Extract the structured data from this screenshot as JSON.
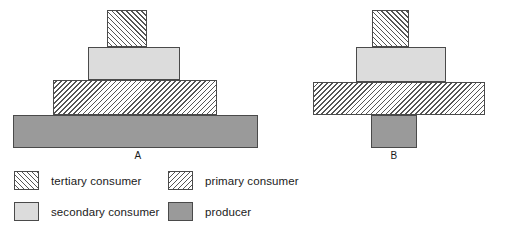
{
  "figure": {
    "type": "ecological-pyramid-comparison",
    "pyramids": [
      {
        "label": "A",
        "shape": "upright-pyramid",
        "tiers": [
          {
            "name": "tertiary consumer",
            "fill": "tertiary",
            "x": 107,
            "y": 10,
            "w": 40,
            "h": 37
          },
          {
            "name": "secondary consumer",
            "fill": "secondary",
            "x": 88,
            "y": 47,
            "w": 92,
            "h": 33
          },
          {
            "name": "primary consumer",
            "fill": "primary",
            "x": 53,
            "y": 80,
            "w": 164,
            "h": 35
          },
          {
            "name": "producer",
            "fill": "producer",
            "x": 13,
            "y": 115,
            "w": 245,
            "h": 33
          }
        ],
        "label_x": 118,
        "label_y": 150,
        "label_w": 40
      },
      {
        "label": "B",
        "shape": "irregular-inverted-base",
        "tiers": [
          {
            "name": "tertiary consumer",
            "fill": "tertiary",
            "x": 82,
            "y": 10,
            "w": 37,
            "h": 37
          },
          {
            "name": "secondary consumer",
            "fill": "secondary",
            "x": 66,
            "y": 47,
            "w": 90,
            "h": 35
          },
          {
            "name": "primary consumer",
            "fill": "primary",
            "x": 23,
            "y": 82,
            "w": 172,
            "h": 33
          },
          {
            "name": "producer",
            "fill": "producer",
            "x": 81,
            "y": 115,
            "w": 46,
            "h": 33
          }
        ],
        "label_x": 89,
        "label_y": 150,
        "label_w": 30
      }
    ]
  },
  "legend": {
    "items": [
      {
        "label": "tertiary consumer",
        "fill": "tertiary",
        "col": 1,
        "row": 1
      },
      {
        "label": "primary consumer",
        "fill": "primary",
        "col": 2,
        "row": 1
      },
      {
        "label": "secondary consumer",
        "fill": "secondary",
        "col": 1,
        "row": 2
      },
      {
        "label": "producer",
        "fill": "producer",
        "col": 2,
        "row": 2
      }
    ]
  },
  "colors": {
    "secondary_consumer": "#dcdcdc",
    "producer": "#9a9a9a",
    "hatch_line": "#555555",
    "outline": "#4a4a4a",
    "background": "#ffffff",
    "text": "#1a1a1a"
  }
}
